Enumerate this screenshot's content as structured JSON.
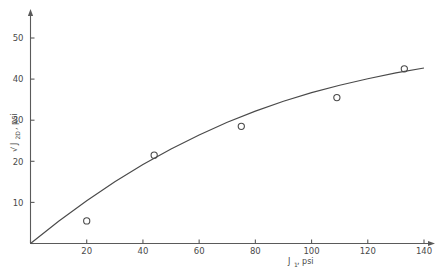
{
  "chart_data": {
    "type": "scatter",
    "title": "",
    "xlabel": "J1, psi",
    "xlabel_base": "J",
    "xlabel_sub": "1",
    "xlabel_unit": ", psi",
    "ylabel": "sqrt(J2D), psi",
    "ylabel_radical": "√",
    "ylabel_base": "J",
    "ylabel_sub": "2D",
    "ylabel_unit": ", psi",
    "xlim": [
      0,
      140
    ],
    "ylim": [
      0,
      57
    ],
    "xticks": [
      0,
      20,
      40,
      60,
      80,
      100,
      120,
      140
    ],
    "xtick_labels": [
      "",
      "20",
      "40",
      "60",
      "80",
      "100",
      "120",
      "140"
    ],
    "yticks": [
      0,
      10,
      20,
      30,
      40,
      50
    ],
    "ytick_labels": [
      "",
      "10",
      "20",
      "30",
      "40",
      "50"
    ],
    "grid": false,
    "legend": "none",
    "marker": "open-circle",
    "points": [
      {
        "x": 20,
        "y": 5.5
      },
      {
        "x": 44,
        "y": 21.5
      },
      {
        "x": 75,
        "y": 28.5
      },
      {
        "x": 109,
        "y": 35.5
      },
      {
        "x": 133,
        "y": 42.5
      }
    ],
    "fit_curve": [
      {
        "x": 0,
        "y": 0
      },
      {
        "x": 10,
        "y": 5.4
      },
      {
        "x": 20,
        "y": 10.4
      },
      {
        "x": 30,
        "y": 15.0
      },
      {
        "x": 40,
        "y": 19.2
      },
      {
        "x": 50,
        "y": 23.0
      },
      {
        "x": 60,
        "y": 26.4
      },
      {
        "x": 70,
        "y": 29.5
      },
      {
        "x": 80,
        "y": 32.2
      },
      {
        "x": 90,
        "y": 34.6
      },
      {
        "x": 100,
        "y": 36.7
      },
      {
        "x": 110,
        "y": 38.5
      },
      {
        "x": 120,
        "y": 40.1
      },
      {
        "x": 130,
        "y": 41.5
      },
      {
        "x": 140,
        "y": 42.7
      }
    ],
    "colors": {
      "axis": "#5a5a5a",
      "curve": "#4a4a4a",
      "marker": "#4a4a4a",
      "text": "#4a4a4a",
      "background": "#ffffff"
    }
  }
}
